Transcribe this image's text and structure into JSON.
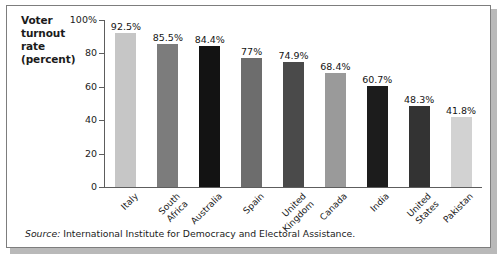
{
  "figure": {
    "y_axis_title_lines": [
      "Voter",
      "turnout",
      "rate",
      "(percent)"
    ],
    "source_prefix": "Source:",
    "source_text": " International Institute for Democracy and Electoral Assistance."
  },
  "chart_data": {
    "type": "bar",
    "title": "",
    "xlabel": "",
    "ylabel": "Voter turnout rate (percent)",
    "ylim": [
      0,
      100
    ],
    "yticks": [
      0,
      20,
      40,
      60,
      80,
      100
    ],
    "ytick_labels": [
      "0",
      "20",
      "40",
      "60",
      "80",
      "100%"
    ],
    "grid": false,
    "legend": "none",
    "categories": [
      "Italy",
      "South Africa",
      "Australia",
      "Spain",
      "United Kingdom",
      "Canada",
      "India",
      "United States",
      "Pakistan"
    ],
    "category_label_lines": [
      [
        "Italy"
      ],
      [
        "South",
        "Africa"
      ],
      [
        "Australia"
      ],
      [
        "Spain"
      ],
      [
        "United",
        "Kingdom"
      ],
      [
        "Canada"
      ],
      [
        "India"
      ],
      [
        "United",
        "States"
      ],
      [
        "Pakistan"
      ]
    ],
    "values": [
      92.5,
      85.5,
      84.4,
      77,
      74.9,
      68.4,
      60.7,
      48.3,
      41.8
    ],
    "value_labels": [
      "92.5%",
      "85.5%",
      "84.4%",
      "77%",
      "74.9%",
      "68.4%",
      "60.7%",
      "48.3%",
      "41.8%"
    ],
    "bar_colors": [
      "#c6c6c6",
      "#7c7c7c",
      "#131313",
      "#6d6d6d",
      "#4a4a4a",
      "#9a9a9a",
      "#1c1c1c",
      "#333333",
      "#d2d2d2"
    ]
  }
}
